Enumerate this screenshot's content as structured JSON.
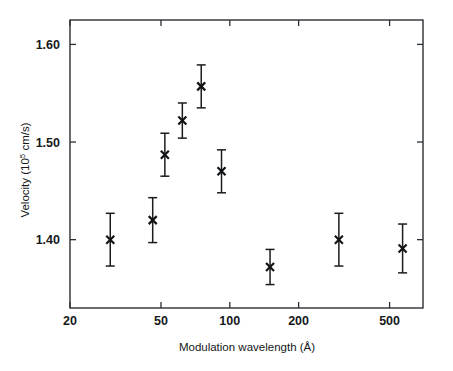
{
  "figure": {
    "background_color": "#ffffff",
    "foreground_color": "#16181a",
    "width": 453,
    "height": 371
  },
  "axes": {
    "x_title_main": "Modulation wavelength (",
    "x_title_unit": "Å",
    "x_title_close": ")",
    "x_title_full": "Modulation wavelength (Å)",
    "y_title_main": "Velocity (10",
    "y_title_sup": "5",
    "y_title_tail": " cm/s)",
    "y_title_full": "Velocity (10⁵ cm/s)",
    "x_tick_labels": [
      "20",
      "50",
      "100",
      "200",
      "500"
    ],
    "x_tick_values": [
      20,
      50,
      100,
      200,
      500
    ],
    "y_tick_labels": [
      "1.40",
      "1.50",
      "1.60"
    ],
    "y_tick_values": [
      1.4,
      1.5,
      1.6
    ]
  },
  "chart_data": {
    "type": "scatter",
    "title": "",
    "subtitle": "",
    "xlabel": "Modulation wavelength (Å)",
    "ylabel": "Velocity (10⁵ cm/s)",
    "xscale": "log",
    "yscale": "linear",
    "xlim": [
      20,
      700
    ],
    "ylim": [
      1.33,
      1.625
    ],
    "grid": false,
    "legend": null,
    "marker": "x",
    "error_bars": "vertical",
    "x": [
      30,
      46,
      52,
      62,
      75,
      92,
      150,
      300,
      570
    ],
    "y": [
      1.4,
      1.42,
      1.487,
      1.522,
      1.557,
      1.47,
      1.372,
      1.4,
      1.391
    ],
    "yerr": [
      0.027,
      0.023,
      0.022,
      0.018,
      0.022,
      0.022,
      0.018,
      0.027,
      0.025
    ],
    "points": [
      {
        "x": 30,
        "y": 1.4,
        "yerr": 0.027,
        "ylow": 1.373,
        "yhigh": 1.427
      },
      {
        "x": 46,
        "y": 1.42,
        "yerr": 0.023,
        "ylow": 1.397,
        "yhigh": 1.443
      },
      {
        "x": 52,
        "y": 1.487,
        "yerr": 0.022,
        "ylow": 1.465,
        "yhigh": 1.509
      },
      {
        "x": 62,
        "y": 1.522,
        "yerr": 0.018,
        "ylow": 1.504,
        "yhigh": 1.54
      },
      {
        "x": 75,
        "y": 1.557,
        "yerr": 0.022,
        "ylow": 1.535,
        "yhigh": 1.579
      },
      {
        "x": 92,
        "y": 1.47,
        "yerr": 0.022,
        "ylow": 1.448,
        "yhigh": 1.492
      },
      {
        "x": 150,
        "y": 1.372,
        "yerr": 0.018,
        "ylow": 1.354,
        "yhigh": 1.39
      },
      {
        "x": 300,
        "y": 1.4,
        "yerr": 0.027,
        "ylow": 1.373,
        "yhigh": 1.427
      },
      {
        "x": 570,
        "y": 1.391,
        "yerr": 0.025,
        "ylow": 1.366,
        "yhigh": 1.416
      }
    ]
  }
}
